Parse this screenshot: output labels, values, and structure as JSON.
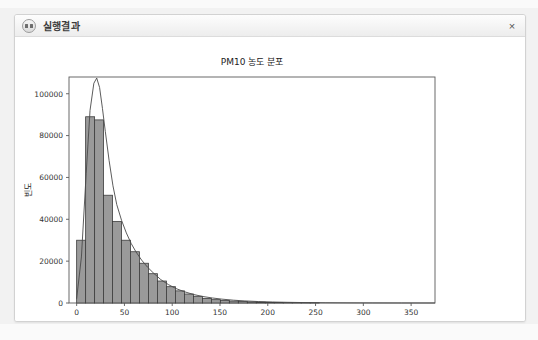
{
  "window": {
    "title": "실행결과",
    "icon": "app-circle-icon",
    "close_label": "×"
  },
  "colors": {
    "page_background": "#f2f2f2",
    "window_background": "#ffffff",
    "titlebar_background": "#f4f4f4",
    "bar_fill": "#9a9a9a",
    "bar_edge": "#3d3d3d",
    "kde_line": "#4a4a4a",
    "axis": "#5a5a5a",
    "text": "#222222"
  },
  "chart_data": {
    "type": "bar",
    "title": "PM10 농도 분포",
    "xlabel": "PM10 농도 (µg/m³)",
    "ylabel": "빈도",
    "xlim": [
      -8,
      375
    ],
    "ylim": [
      0,
      108000
    ],
    "xticks": [
      0,
      50,
      100,
      150,
      200,
      250,
      300,
      350
    ],
    "xtick_labels": [
      "0",
      "50",
      "100",
      "150",
      "200",
      "250",
      "300",
      "350"
    ],
    "yticks": [
      0,
      20000,
      40000,
      60000,
      80000,
      100000
    ],
    "ytick_labels": [
      "0",
      "20000",
      "40000",
      "60000",
      "80000",
      "100000"
    ],
    "grid": false,
    "legend": null,
    "bin_width": 9.4,
    "bin_starts": [
      0,
      9.4,
      18.8,
      28.2,
      37.6,
      47,
      56.4,
      65.8,
      75.2,
      84.6,
      94,
      103.4,
      112.8,
      122.2,
      131.6,
      141,
      150.4,
      159.8,
      169.2,
      178.6,
      188,
      197.4,
      206.8,
      216.2,
      225.6,
      235,
      244.4,
      253.8,
      263.2,
      272.6,
      282,
      291.4,
      300.8,
      310.2,
      319.6,
      329,
      338.4,
      347.8,
      357.2,
      366.6
    ],
    "categories": [
      "0-9",
      "9-19",
      "19-28",
      "28-38",
      "38-47",
      "47-56",
      "56-66",
      "66-75",
      "75-85",
      "85-94",
      "94-103",
      "103-113",
      "113-122",
      "122-132",
      "132-141",
      "141-150",
      "150-160",
      "160-169",
      "169-179",
      "179-188",
      "188-197",
      "197-207",
      "207-216",
      "216-226",
      "226-235",
      "235-244",
      "244-254",
      "254-263",
      "263-272",
      "272-282",
      "282-291",
      "291-301",
      "301-310",
      "310-320",
      "320-329",
      "329-338",
      "338-348",
      "348-357",
      "357-367",
      "367-376"
    ],
    "values": [
      30000,
      89000,
      87500,
      51500,
      39000,
      30000,
      24500,
      19000,
      14000,
      10500,
      7800,
      5800,
      4300,
      3200,
      2200,
      1600,
      1200,
      900,
      700,
      520,
      400,
      300,
      230,
      175,
      135,
      100,
      80,
      62,
      48,
      38,
      30,
      24,
      19,
      15,
      12,
      9,
      7,
      6,
      5,
      4
    ],
    "kde": {
      "label": "density-curve",
      "x": [
        0,
        5,
        10,
        14,
        18,
        21,
        24,
        27,
        30,
        34,
        38,
        42,
        47,
        52,
        57,
        62,
        68,
        74,
        80,
        88,
        96,
        104,
        112,
        122,
        132,
        142,
        152,
        164,
        176,
        190,
        205,
        220,
        240,
        260,
        285,
        310,
        340,
        375
      ],
      "y": [
        2000,
        22000,
        62000,
        92000,
        105000,
        107500,
        103000,
        93000,
        82000,
        68000,
        56000,
        47000,
        39500,
        33500,
        28500,
        24500,
        20500,
        17200,
        14500,
        11200,
        8800,
        6900,
        5500,
        4100,
        3100,
        2400,
        1850,
        1350,
        1000,
        700,
        480,
        330,
        190,
        115,
        60,
        32,
        14,
        5
      ]
    }
  }
}
